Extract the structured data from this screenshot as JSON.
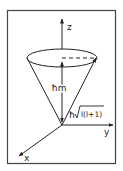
{
  "diagram": {
    "type": "angular-momentum-vector-cone",
    "axes": {
      "z_label": "z",
      "y_label": "y",
      "x_label": "x"
    },
    "labels": {
      "z_projection": "ħm",
      "magnitude_prefix": "ħ",
      "magnitude_radicand": "l(l+1)"
    },
    "colors": {
      "stroke": "#222222",
      "frame": "#444444",
      "background": "#ffffff"
    }
  }
}
